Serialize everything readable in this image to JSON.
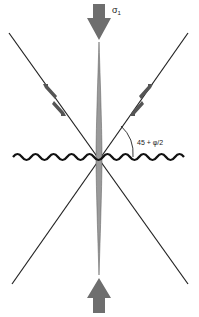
{
  "diagram": {
    "type": "fault-stress-geometry",
    "labels": {
      "sigma": "σ",
      "sigma_sub": "1",
      "angle": "45 + φ/2"
    },
    "colors": {
      "line": "#222222",
      "arrow_fill": "#6e6e6e",
      "spindle_fill": "#9a9a9a",
      "wave": "#111111",
      "background": "#ffffff"
    },
    "elements": [
      {
        "id": "sigma1-top-arrow",
        "description": "compressive stress arrow pointing down"
      },
      {
        "id": "sigma1-bottom-arrow",
        "description": "compressive stress arrow pointing up"
      },
      {
        "id": "fault-left",
        "description": "conjugate shear fault, left-dipping"
      },
      {
        "id": "fault-right",
        "description": "conjugate shear fault, right-dipping"
      },
      {
        "id": "extension-fracture",
        "description": "vertical spindle parallel to sigma1"
      },
      {
        "id": "stylolite",
        "description": "wavy horizontal line perpendicular to sigma1"
      },
      {
        "id": "angle-arc",
        "description": "angle between fault and stylolite"
      }
    ]
  }
}
